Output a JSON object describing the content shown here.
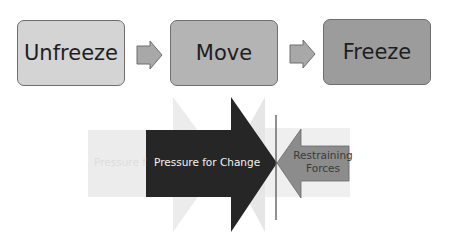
{
  "stages": [
    {
      "label": "Unfreeze",
      "color": "#d4d4d4"
    },
    {
      "label": "Move",
      "color": "#b4b4b4"
    },
    {
      "label": "Freeze",
      "color": "#9c9c9c"
    }
  ],
  "force_field": {
    "faded_label": "Pressure f",
    "driving_label": "Pressure for Change",
    "restraining_label_line1": "Restraining",
    "restraining_label_line2": "Forces",
    "colors": {
      "driving": "#262626",
      "restraining": "#8c8c8c",
      "faded": "#ececec",
      "line": "#555555"
    }
  }
}
